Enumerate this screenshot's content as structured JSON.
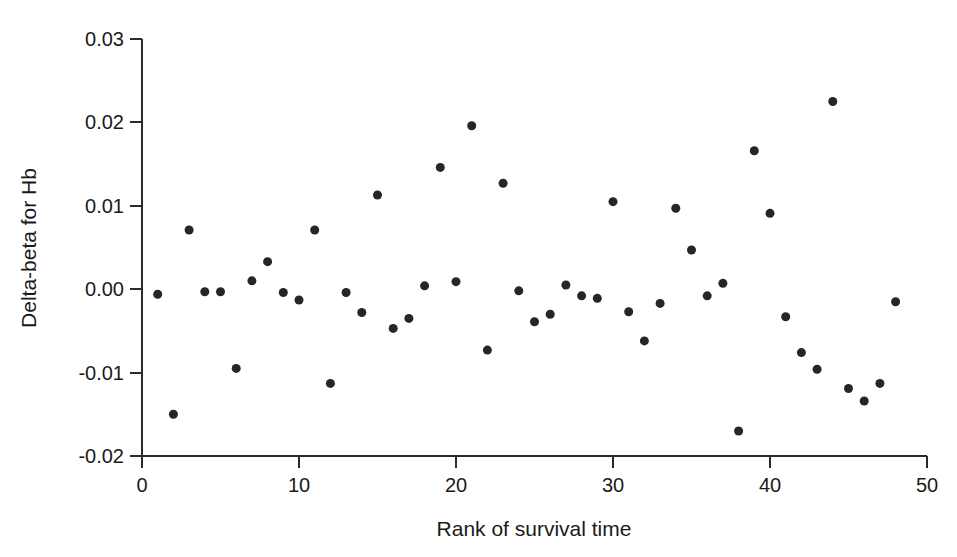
{
  "chart_data": {
    "type": "scatter",
    "title": "",
    "xlabel": "Rank of survival time",
    "ylabel": "Delta-beta for Hb",
    "xlim": [
      0,
      50
    ],
    "ylim": [
      -0.02,
      0.03
    ],
    "xticks": [
      0,
      10,
      20,
      30,
      40,
      50
    ],
    "xtick_labels": [
      "0",
      "10",
      "20",
      "30",
      "40",
      "50"
    ],
    "yticks": [
      -0.02,
      -0.01,
      0.0,
      0.01,
      0.02,
      0.03
    ],
    "ytick_labels": [
      "-0.02",
      "-0.01",
      "0.00",
      "0.01",
      "0.02",
      "0.03"
    ],
    "grid": false,
    "legend": null,
    "marker": "filled-circle",
    "marker_color": "#262626",
    "marker_size_px": 9,
    "x": [
      1,
      2,
      3,
      4,
      5,
      6,
      7,
      8,
      9,
      10,
      11,
      12,
      13,
      14,
      15,
      16,
      17,
      18,
      19,
      20,
      21,
      22,
      23,
      24,
      25,
      26,
      27,
      28,
      29,
      30,
      31,
      32,
      33,
      34,
      35,
      36,
      37,
      38,
      39,
      40,
      41,
      42,
      43,
      44,
      45,
      46,
      47,
      48
    ],
    "y": [
      -0.0006,
      -0.015,
      0.0071,
      -0.0003,
      -0.0003,
      -0.0095,
      0.001,
      0.0033,
      -0.0004,
      -0.0013,
      0.0071,
      -0.0113,
      -0.0004,
      -0.0028,
      0.0113,
      -0.0047,
      -0.0035,
      0.0004,
      0.0146,
      0.0009,
      0.0196,
      -0.0073,
      0.0127,
      -0.0002,
      -0.0039,
      -0.003,
      0.0005,
      -0.0008,
      -0.0011,
      0.0105,
      -0.0027,
      -0.0062,
      -0.0017,
      0.0097,
      0.0047,
      -0.0008,
      0.0007,
      -0.017,
      0.0166,
      0.0091,
      -0.0033,
      -0.0076,
      -0.0096,
      0.0225,
      -0.0119,
      -0.0134,
      -0.0113,
      -0.0015
    ]
  },
  "axis": {
    "x_title": "Rank of survival time",
    "y_title": "Delta-beta for Hb"
  }
}
